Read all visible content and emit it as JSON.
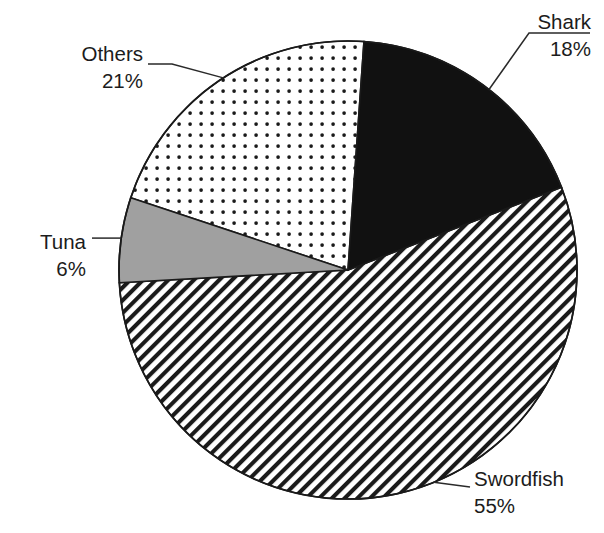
{
  "chart_data": {
    "type": "pie",
    "title": "",
    "subtitle": "",
    "xlabel": "",
    "ylabel": "",
    "grid": false,
    "legend_position": "none",
    "label_style": "outside-with-leader-lines",
    "units": "percent",
    "total": 100,
    "categories": [
      "Shark",
      "Swordfish",
      "Tuna",
      "Others"
    ],
    "values": [
      18,
      55,
      6,
      21
    ],
    "slices": [
      {
        "name": "Shark",
        "label": "Shark",
        "value": 18,
        "value_text": "18%",
        "fill_style": "solid-black",
        "fill_color": "#111111",
        "start_angle_deg": 4,
        "end_angle_deg": 68.8,
        "label_position": "top-right"
      },
      {
        "name": "Swordfish",
        "label": "Swordfish",
        "value": 55,
        "value_text": "55%",
        "fill_style": "diagonal-hatch",
        "fill_color": "#ffffff",
        "hatch_color": "#1a1a1a",
        "start_angle_deg": 68.8,
        "end_angle_deg": 266.8,
        "label_position": "bottom-right"
      },
      {
        "name": "Tuna",
        "label": "Tuna",
        "value": 6,
        "value_text": "6%",
        "fill_style": "solid-gray",
        "fill_color": "#a0a0a0",
        "start_angle_deg": 266.8,
        "end_angle_deg": 288.4,
        "label_position": "left"
      },
      {
        "name": "Others",
        "label": "Others",
        "value": 21,
        "value_text": "21%",
        "fill_style": "dotted",
        "fill_color": "#ffffff",
        "dot_color": "#1a1a1a",
        "start_angle_deg": 288.4,
        "end_angle_deg": 364,
        "label_position": "top-left"
      }
    ],
    "geometry": {
      "center_x": 348,
      "center_y": 270,
      "radius": 229,
      "outline_color": "#1a1a1a"
    }
  },
  "colors": {
    "background": "#ffffff",
    "outline": "#1a1a1a",
    "text": "#1c1c1c",
    "leader_line": "#2a2a2a",
    "gray_slice": "#a0a0a0",
    "black_slice": "#111111"
  }
}
